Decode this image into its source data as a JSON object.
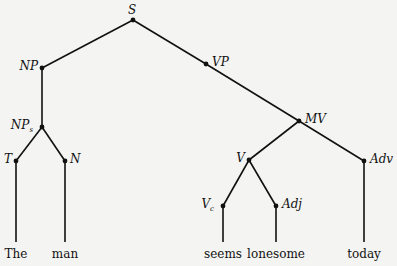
{
  "diagram": {
    "type": "syntax-tree",
    "nodes": [
      {
        "id": "S",
        "label": "S",
        "sub": "",
        "x": 133,
        "y": 20,
        "lx": 128,
        "ly": 14,
        "anchor": "start"
      },
      {
        "id": "NP",
        "label": "NP",
        "sub": "",
        "x": 42,
        "y": 68,
        "lx": 38,
        "ly": 70,
        "anchor": "end"
      },
      {
        "id": "VP",
        "label": "VP",
        "sub": "",
        "x": 206,
        "y": 64,
        "lx": 212,
        "ly": 66,
        "anchor": "start"
      },
      {
        "id": "NPs",
        "label": "NP",
        "sub": "s",
        "x": 42,
        "y": 127,
        "lx": 33,
        "ly": 129,
        "anchor": "end"
      },
      {
        "id": "T",
        "label": "T",
        "sub": "",
        "x": 16,
        "y": 161,
        "lx": 12,
        "ly": 163,
        "anchor": "end"
      },
      {
        "id": "N",
        "label": "N",
        "sub": "",
        "x": 65,
        "y": 161,
        "lx": 70,
        "ly": 163,
        "anchor": "start"
      },
      {
        "id": "MV",
        "label": "MV",
        "sub": "",
        "x": 299,
        "y": 121,
        "lx": 305,
        "ly": 123,
        "anchor": "start"
      },
      {
        "id": "V",
        "label": "V",
        "sub": "",
        "x": 249,
        "y": 160,
        "lx": 245,
        "ly": 162,
        "anchor": "end"
      },
      {
        "id": "Adv",
        "label": "Adv",
        "sub": "",
        "x": 364,
        "y": 161,
        "lx": 370,
        "ly": 163,
        "anchor": "start"
      },
      {
        "id": "Vc",
        "label": "V",
        "sub": "c",
        "x": 223,
        "y": 206,
        "lx": 214,
        "ly": 208,
        "anchor": "end"
      },
      {
        "id": "Adj",
        "label": "Adj",
        "sub": "",
        "x": 276,
        "y": 206,
        "lx": 282,
        "ly": 208,
        "anchor": "start"
      }
    ],
    "edges": [
      [
        "S",
        "NP"
      ],
      [
        "S",
        "VP"
      ],
      [
        "NP",
        "NPs"
      ],
      [
        "NPs",
        "T"
      ],
      [
        "NPs",
        "N"
      ],
      [
        "VP",
        "MV"
      ],
      [
        "MV",
        "V"
      ],
      [
        "MV",
        "Adv"
      ],
      [
        "V",
        "Vc"
      ],
      [
        "V",
        "Adj"
      ]
    ],
    "leaves": [
      {
        "parent": "T",
        "word": "The",
        "x": 16,
        "y": 258
      },
      {
        "parent": "N",
        "word": "man",
        "x": 65,
        "y": 258
      },
      {
        "parent": "Vc",
        "word": "seems",
        "x": 223,
        "y": 258
      },
      {
        "parent": "Adj",
        "word": "lonesome",
        "x": 276,
        "y": 258
      },
      {
        "parent": "Adv",
        "word": "today",
        "x": 364,
        "y": 258
      }
    ],
    "leaf_line_end_y": 242
  },
  "colors": {
    "ink": "#111111",
    "paper": "#f4f4f2"
  }
}
